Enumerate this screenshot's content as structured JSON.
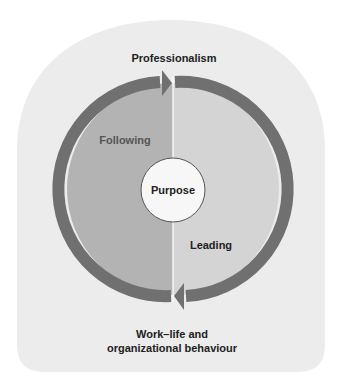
{
  "diagram": {
    "top_label": "Professionalism",
    "left_label": "Following",
    "right_label": "Leading",
    "center_label": "Purpose",
    "bottom_label_line1": "Work–life and",
    "bottom_label_line2": "organizational behaviour"
  },
  "colors": {
    "background_card": "#ececec",
    "left_half": "#b3b3b3",
    "right_half": "#d4d4d4",
    "ring": "#707070",
    "center_circle": "#f7f7f7"
  }
}
